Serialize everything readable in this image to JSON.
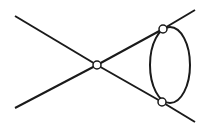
{
  "diagram": {
    "type": "feynman-diagram",
    "stroke_color": "#1a1a1a",
    "vertex_fill": "#ffffff",
    "lines": [
      {
        "id": "external-upper-left",
        "x1": 15,
        "y1": 16,
        "x2": 97,
        "y2": 65
      },
      {
        "id": "external-lower-left",
        "x1": 15,
        "y1": 108,
        "x2": 97,
        "y2": 65
      },
      {
        "id": "internal-upper",
        "x1": 97,
        "y1": 65,
        "x2": 163,
        "y2": 29
      },
      {
        "id": "internal-lower",
        "x1": 97,
        "y1": 65,
        "x2": 162,
        "y2": 102
      },
      {
        "id": "external-upper-right",
        "x1": 163,
        "y1": 29,
        "x2": 195,
        "y2": 10
      },
      {
        "id": "external-lower-right",
        "x1": 162,
        "y1": 102,
        "x2": 195,
        "y2": 122
      }
    ],
    "loop": {
      "cx": 170,
      "cy": 65,
      "rx": 20,
      "ry": 38
    },
    "vertices": [
      {
        "id": "center",
        "cx": 97,
        "cy": 65,
        "r": 4
      },
      {
        "id": "upper-right",
        "cx": 163,
        "cy": 29,
        "r": 4
      },
      {
        "id": "lower-right",
        "cx": 162,
        "cy": 102,
        "r": 4
      }
    ]
  }
}
